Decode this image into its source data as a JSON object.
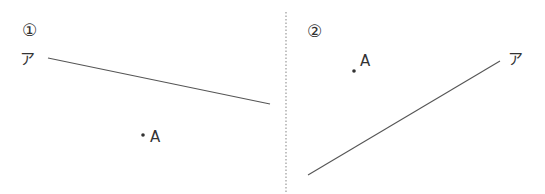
{
  "panels": [
    {
      "number": "①",
      "line_label": "ア",
      "point_label": "A",
      "line": {
        "x1": 48,
        "y1": 58,
        "x2": 270,
        "y2": 104
      },
      "point": {
        "x": 143,
        "y": 135
      },
      "number_pos": {
        "x": 22,
        "y": 36
      },
      "line_label_pos": {
        "x": 20,
        "y": 64
      },
      "point_label_pos": {
        "x": 150,
        "y": 142
      }
    },
    {
      "number": "②",
      "line_label": "ア",
      "point_label": "A",
      "line": {
        "x1": 308,
        "y1": 175,
        "x2": 500,
        "y2": 61
      },
      "point": {
        "x": 354,
        "y": 71
      },
      "number_pos": {
        "x": 307,
        "y": 37
      },
      "line_label_pos": {
        "x": 508,
        "y": 64
      },
      "point_label_pos": {
        "x": 360,
        "y": 66
      }
    }
  ],
  "divider": {
    "x": 286,
    "y1": 12,
    "y2": 194
  },
  "colors": {
    "line": "#555555",
    "text": "#333333",
    "divider": "#999999"
  }
}
